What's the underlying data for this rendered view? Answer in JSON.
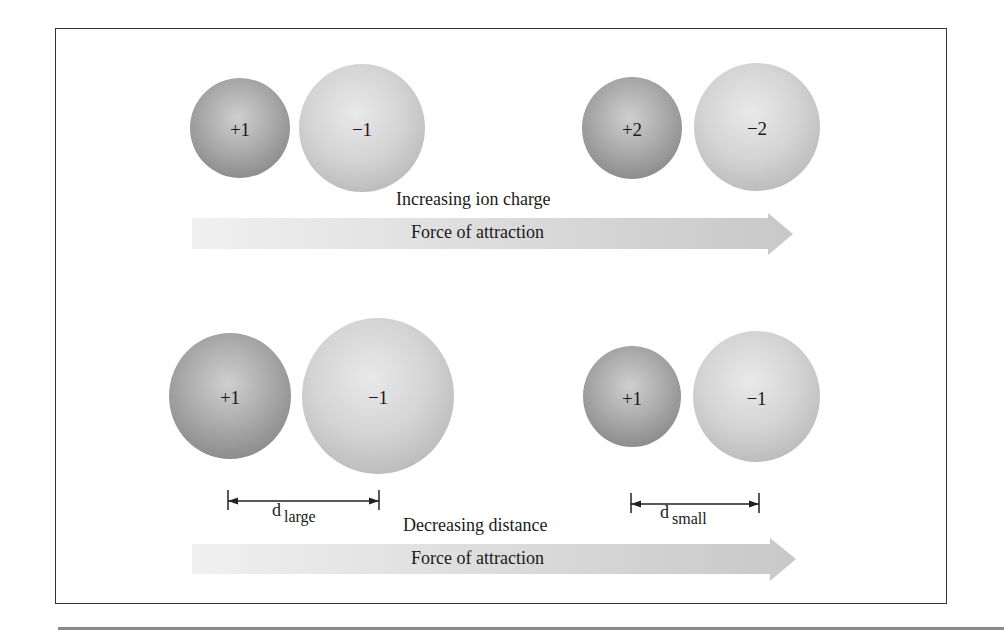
{
  "figure": {
    "top_panel": {
      "pairs": [
        {
          "cation": {
            "label": "+1"
          },
          "anion": {
            "label": "−1"
          }
        },
        {
          "cation": {
            "label": "+2"
          },
          "anion": {
            "label": "−2"
          }
        }
      ],
      "trend_label": "Increasing ion charge",
      "arrow_label": "Force of attraction"
    },
    "bottom_panel": {
      "pairs": [
        {
          "cation": {
            "label": "+1"
          },
          "anion": {
            "label": "−1"
          },
          "distance": {
            "symbol": "d",
            "subscript": "large"
          }
        },
        {
          "cation": {
            "label": "+1"
          },
          "anion": {
            "label": "−1"
          },
          "distance": {
            "symbol": "d",
            "subscript": "small"
          }
        }
      ],
      "trend_label": "Decreasing distance",
      "arrow_label": "Force of attraction"
    },
    "colors": {
      "cation": "#a9a9a9",
      "anion": "#d4d4d4",
      "arrow_start": "#f0f0f0",
      "arrow_end": "#c8c8c8",
      "frame": "#333333"
    }
  }
}
